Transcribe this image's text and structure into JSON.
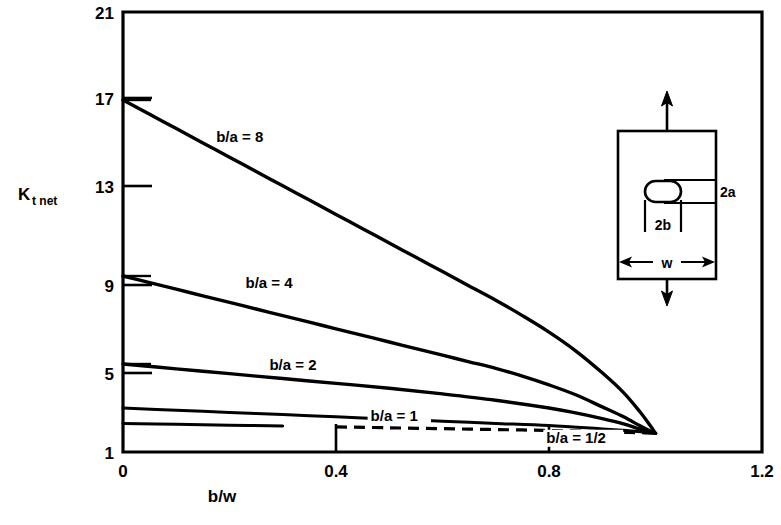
{
  "chart_data": {
    "type": "line",
    "title": "",
    "xlabel": "b/w",
    "ylabel": "Kt net",
    "ylabel_main": "K",
    "ylabel_sub": "t net",
    "xlim": [
      0,
      1.2
    ],
    "ylim": [
      1,
      21
    ],
    "xticks": [
      0,
      0.4,
      0.8,
      1.2
    ],
    "xtick_labels": [
      "0",
      "0.4",
      "0.8",
      "1.2"
    ],
    "yticks": [
      1,
      5,
      9,
      13,
      17,
      21
    ],
    "ytick_labels": [
      "1",
      "5",
      "9",
      "13",
      "17",
      "21"
    ],
    "grid": false,
    "legend_position": "inline-annotations",
    "series": [
      {
        "name": "b/a = 8",
        "label": "b/a = 8",
        "style": "solid",
        "label_x": 0.175,
        "label_y": 15.1,
        "x": [
          0.0,
          0.05,
          0.1,
          0.15,
          0.2,
          0.25,
          0.3,
          0.35,
          0.4,
          0.45,
          0.5,
          0.55,
          0.6,
          0.65,
          0.7,
          0.75,
          0.8,
          0.85,
          0.9,
          0.94,
          0.97,
          0.99,
          1.0
        ],
        "y": [
          17.0,
          16.35,
          15.7,
          15.05,
          14.4,
          13.75,
          13.1,
          12.45,
          11.8,
          11.15,
          10.5,
          9.85,
          9.2,
          8.55,
          7.9,
          7.2,
          6.45,
          5.6,
          4.6,
          3.7,
          2.85,
          2.2,
          1.85
        ]
      },
      {
        "name": "b/a = 4",
        "label": "b/a = 4",
        "style": "solid",
        "label_x": 0.23,
        "label_y": 8.45,
        "x": [
          0.0,
          0.05,
          0.1,
          0.15,
          0.2,
          0.25,
          0.3,
          0.35,
          0.4,
          0.45,
          0.5,
          0.55,
          0.6,
          0.65,
          0.7,
          0.75,
          0.8,
          0.85,
          0.9,
          0.94,
          0.97,
          0.99,
          1.0
        ],
        "y": [
          9.0,
          8.7,
          8.4,
          8.1,
          7.8,
          7.5,
          7.2,
          6.9,
          6.6,
          6.3,
          6.0,
          5.7,
          5.4,
          5.1,
          4.8,
          4.45,
          4.05,
          3.6,
          3.05,
          2.6,
          2.2,
          1.95,
          1.85
        ]
      },
      {
        "name": "b/a = 2",
        "label": "b/a = 2",
        "style": "solid",
        "label_x": 0.275,
        "label_y": 4.72,
        "x": [
          0.0,
          0.1,
          0.2,
          0.3,
          0.4,
          0.5,
          0.6,
          0.7,
          0.8,
          0.85,
          0.9,
          0.94,
          0.97,
          0.99,
          1.0
        ],
        "y": [
          5.0,
          4.78,
          4.56,
          4.34,
          4.12,
          3.9,
          3.64,
          3.35,
          3.0,
          2.78,
          2.52,
          2.28,
          2.05,
          1.92,
          1.85
        ]
      },
      {
        "name": "b/a = 1",
        "label": "b/a = 1",
        "style": "solid",
        "label_x": 0.465,
        "label_y": 2.42,
        "x": [
          0.0,
          0.1,
          0.2,
          0.3,
          0.4,
          0.5,
          0.6,
          0.7,
          0.8,
          0.9,
          0.95,
          0.98,
          1.0
        ],
        "y": [
          3.0,
          2.9,
          2.8,
          2.7,
          2.6,
          2.5,
          2.4,
          2.3,
          2.2,
          2.05,
          1.97,
          1.9,
          1.85
        ]
      },
      {
        "name": "b/a = 1/2",
        "label": "b/a = 1/2",
        "style": "dashed",
        "label_x": 0.795,
        "label_y": 1.42,
        "solid_until": 0.38,
        "x": [
          0.0,
          0.1,
          0.2,
          0.3,
          0.4,
          0.5,
          0.6,
          0.7,
          0.8,
          0.9,
          0.95,
          0.98,
          1.0
        ],
        "y": [
          2.3,
          2.26,
          2.22,
          2.18,
          2.14,
          2.1,
          2.06,
          2.02,
          1.98,
          1.92,
          1.89,
          1.87,
          1.85
        ]
      }
    ]
  },
  "inset": {
    "name": "specimen-diagram",
    "labels": {
      "hole_height": "2a",
      "hole_width": "2b",
      "plate_width": "w"
    },
    "arrows": {
      "top": "tension-up",
      "bottom": "tension-down"
    }
  }
}
